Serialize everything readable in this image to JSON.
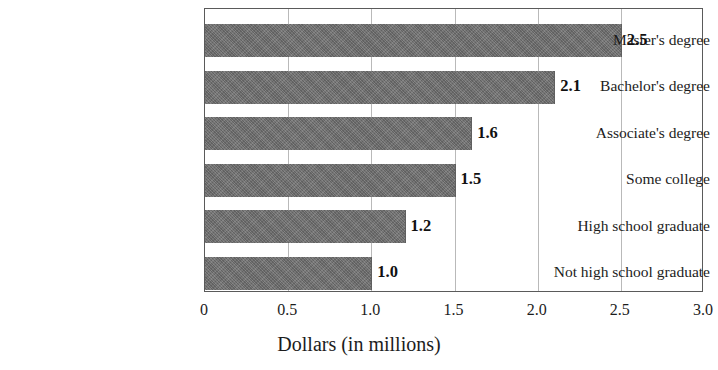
{
  "chart_data": {
    "type": "bar",
    "orientation": "horizontal",
    "title": "",
    "xlabel": "Dollars (in millions)",
    "ylabel": "",
    "xlim": [
      0,
      3.0
    ],
    "xticks": [
      "0",
      "0.5",
      "1.0",
      "1.5",
      "2.0",
      "2.5",
      "3.0"
    ],
    "xtick_values": [
      0,
      0.5,
      1.0,
      1.5,
      2.0,
      2.5,
      3.0
    ],
    "grid": "vertical",
    "legend": null,
    "categories": [
      "Master's degree",
      "Bachelor's degree",
      "Associate's degree",
      "Some college",
      "High school graduate",
      "Not high school graduate"
    ],
    "values": [
      2.5,
      2.1,
      1.6,
      1.5,
      1.2,
      1.0
    ],
    "data_labels": [
      "2.5",
      "2.1",
      "1.6",
      "1.5",
      "1.2",
      "1.0"
    ],
    "bar_color": "#6e6e6e"
  }
}
